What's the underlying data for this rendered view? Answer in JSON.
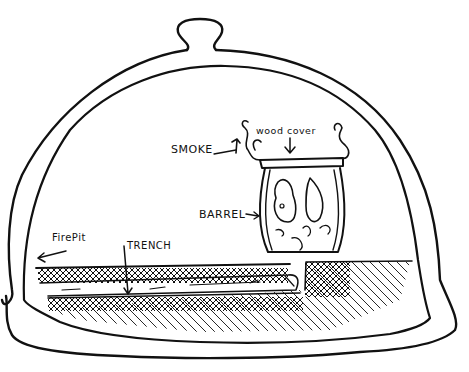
{
  "diagram": {
    "title": "",
    "labels": {
      "smoke": "SMOKE",
      "wood_cover": "wood cover",
      "barrel": "BARREL",
      "fire_pit": "FirePit",
      "trench": "TRENCH"
    },
    "components": [
      "dome",
      "dome-handle",
      "barrel",
      "wood-cover",
      "smoke",
      "trench",
      "fire-pit",
      "ground"
    ],
    "colors": {
      "ink": "#111111",
      "background": "#ffffff"
    }
  }
}
